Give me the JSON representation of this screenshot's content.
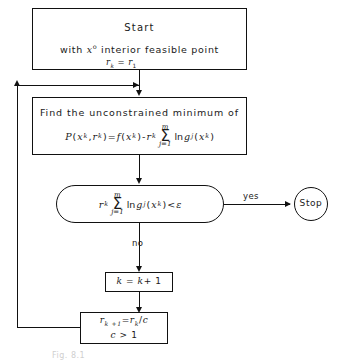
{
  "diagram": {
    "caption": "Fig. 8.1",
    "colors": {
      "line": "#111111",
      "background": "#ffffff",
      "caption": "#cfcfcf"
    }
  },
  "nodes": {
    "start": {
      "shape": "rectangle",
      "line1": "Start",
      "line2_pre": "with ",
      "line2_var": "x",
      "line2_sup": "o",
      "line2_post": " interior  feasible  point"
    },
    "find": {
      "shape": "rectangle",
      "line1": "Find  the  unconstrained  minimum  of",
      "formula": {
        "lhs_P": "P",
        "lhs_x": "x",
        "lhs_x_sup": "k",
        "lhs_r": "r",
        "lhs_r_sub": "k",
        "eq": "=",
        "f": "f",
        "f_x": "x",
        "f_x_sup": "k",
        "minus": "-",
        "r2": "r",
        "r2_sub": "k",
        "sigma_top": "m",
        "sigma_glyph": "Σ",
        "sigma_bot": "j=1",
        "ln": "ln",
        "g": "g",
        "g_sub": "j",
        "g_x": "x",
        "g_x_sup": "k"
      }
    },
    "test": {
      "shape": "stadium",
      "condition": {
        "r": "r",
        "r_sub": "k",
        "sigma_top": "m",
        "sigma_glyph": "Σ",
        "sigma_bot": "j=1",
        "ln": "ln",
        "g": "g",
        "g_sub": "j",
        "g_x": "x",
        "g_x_sup": "k",
        "lt": "<",
        "eps": "ε"
      }
    },
    "stop": {
      "shape": "circle",
      "label": "Stop"
    },
    "increment": {
      "shape": "rectangle",
      "k": "k",
      "eq": "=",
      "k2": "k",
      "plus_one": "+ 1"
    },
    "update": {
      "shape": "rectangle",
      "r_lhs": "r",
      "r_lhs_sub": "k +1",
      "eq": "=",
      "r_rhs": "r",
      "r_rhs_sub": "k",
      "div": "/",
      "c": "c",
      "line2_c": "c",
      "line2_rest": "> 1"
    }
  },
  "edges": {
    "start_to_find_label": {
      "r": "r",
      "r_sub": "k",
      "eq": "=",
      "r2": "r",
      "r2_sub": "1"
    },
    "yes_label": "yes",
    "no_label": "no"
  }
}
